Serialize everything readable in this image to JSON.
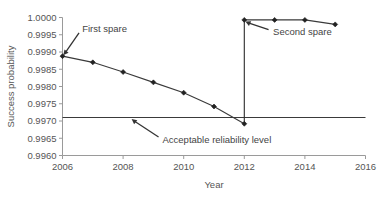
{
  "chart_data": {
    "type": "line",
    "title": "",
    "xlabel": "Year",
    "ylabel": "Success probability",
    "xlim": [
      2006,
      2016
    ],
    "ylim": [
      0.996,
      1.0
    ],
    "grid": false,
    "legend_position": "none",
    "x_ticks": [
      "2006",
      "2008",
      "2010",
      "2012",
      "2014",
      "2016"
    ],
    "x_tick_values": [
      2006,
      2008,
      2010,
      2012,
      2014,
      2016
    ],
    "y_ticks": [
      "0.9960",
      "0.9965",
      "0.9970",
      "0.9975",
      "0.9980",
      "0.9985",
      "0.9990",
      "0.9995",
      "1.0000"
    ],
    "y_tick_values": [
      0.996,
      0.9965,
      0.997,
      0.9975,
      0.998,
      0.9985,
      0.999,
      0.9995,
      1.0
    ],
    "series": [
      {
        "name": "Success probability after first spare",
        "marker": "diamond",
        "x": [
          2006,
          2007,
          2008,
          2009,
          2010,
          2011,
          2012
        ],
        "values": [
          0.99888,
          0.9987,
          0.99842,
          0.99812,
          0.99782,
          0.99742,
          0.99692
        ]
      },
      {
        "name": "Success probability after second spare",
        "marker": "diamond",
        "x": [
          2012,
          2013,
          2014,
          2015
        ],
        "values": [
          0.99993,
          0.99993,
          0.99993,
          0.9998
        ]
      }
    ],
    "vertical_jump": {
      "x": 2012,
      "from": 0.99692,
      "to": 0.99993
    },
    "threshold": {
      "label": "Acceptable reliability level",
      "value": 0.9971,
      "x_start": 2006,
      "x_end": 2016
    },
    "annotations": [
      {
        "text": "First spare",
        "text_x": 2006.65,
        "text_y": 0.99958,
        "target_x": 2006,
        "target_y": 0.99888
      },
      {
        "text": "Second spare",
        "text_x": 2012.95,
        "text_y": 0.9995,
        "target_x": 2012,
        "target_y": 0.9999
      },
      {
        "text": "Acceptable reliability level",
        "text_x": 2009.3,
        "text_y": 0.99636,
        "target_x": 2008.25,
        "target_y": 0.99708
      }
    ]
  },
  "colors": {
    "axis": "#9a9a9a",
    "series": "#3a3a3a",
    "marker": "#222222",
    "threshold": "#3a3a3a",
    "annotation": "#444444",
    "background": "#ffffff"
  }
}
